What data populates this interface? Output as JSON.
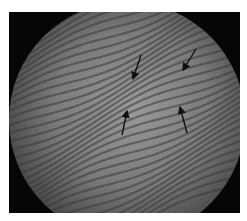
{
  "figure": {
    "kind": "circular interference fringe image",
    "background_color": "#060606",
    "disc_color_center": "#9a9a9a",
    "disc_color_edge": "#555555",
    "fringe_color": "#3a3a3a",
    "arrow_color": "#111111",
    "arrows": [
      {
        "x1": 132,
        "y1": 43,
        "x2": 124,
        "y2": 67
      },
      {
        "x1": 187,
        "y1": 37,
        "x2": 174,
        "y2": 58
      },
      {
        "x1": 113,
        "y1": 123,
        "x2": 118,
        "y2": 99
      },
      {
        "x1": 178,
        "y1": 121,
        "x2": 171,
        "y2": 95
      }
    ]
  }
}
